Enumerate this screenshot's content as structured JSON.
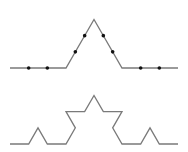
{
  "diagram": {
    "line_color": "#7a7a7a",
    "dot_color": "#111111",
    "line_width": 1.3,
    "dot_radius": 1.8,
    "figures": [
      {
        "name": "koch-level-1",
        "start": [
          10,
          68
        ],
        "end": [
          178,
          68
        ],
        "level": 1,
        "show_dots": true
      },
      {
        "name": "koch-level-2",
        "start": [
          10,
          144
        ],
        "end": [
          178,
          144
        ],
        "level": 2,
        "show_dots": false
      }
    ]
  }
}
